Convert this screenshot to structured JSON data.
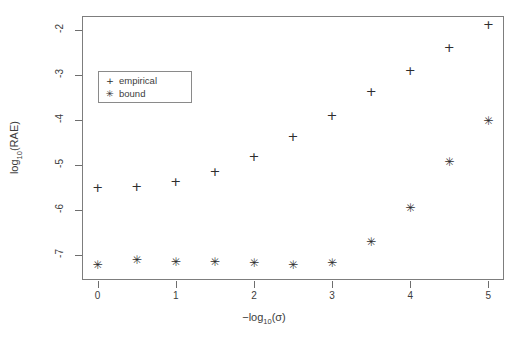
{
  "chart_data": {
    "type": "scatter",
    "title": "",
    "xlabel": "-log10(sigma)",
    "ylabel": "log10(RAE)",
    "xlim": [
      -0.2,
      5.2
    ],
    "ylim": [
      -7.55,
      -1.7
    ],
    "grid": false,
    "legend_position": "upper-left-inside",
    "x_ticks": [
      0,
      1,
      2,
      3,
      4,
      5
    ],
    "x_tick_labels": [
      "0",
      "1",
      "2",
      "3",
      "4",
      "5"
    ],
    "y_ticks": [
      -2,
      -3,
      -4,
      -5,
      -6,
      -7
    ],
    "y_tick_labels": [
      "-2",
      "-3",
      "-4",
      "-5",
      "-6",
      "-7"
    ],
    "x": [
      0,
      0.5,
      1,
      1.5,
      2,
      2.5,
      3,
      3.5,
      4,
      4.5,
      5
    ],
    "series": [
      {
        "name": "empirical",
        "marker": "plus",
        "glyph": "+",
        "color": "#2e2e2e",
        "values": [
          -5.5,
          -5.47,
          -5.37,
          -5.15,
          -4.82,
          -4.37,
          -3.9,
          -3.38,
          -2.9,
          -2.4,
          -1.88
        ]
      },
      {
        "name": "bound",
        "marker": "asterisk",
        "glyph": "✳",
        "color": "#2e2e2e",
        "values": [
          -7.23,
          -7.12,
          -7.16,
          -7.17,
          -7.19,
          -7.22,
          -7.18,
          -6.72,
          -5.97,
          -4.95,
          -4.03
        ]
      }
    ]
  },
  "axes": {
    "x_title_prefix": "−log",
    "x_title_sub": "10",
    "x_title_suffix": "(σ)",
    "y_title_prefix": "log",
    "y_title_sub": "10",
    "y_title_suffix": "(RAE)"
  },
  "legend": {
    "entries": [
      {
        "glyph": "+",
        "label": "empirical"
      },
      {
        "glyph": "✳",
        "label": "bound"
      }
    ]
  }
}
